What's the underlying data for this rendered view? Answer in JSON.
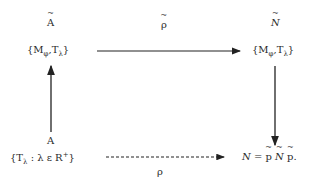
{
  "diagram": {
    "nodes": {
      "top_left_label": "A",
      "top_left": {
        "open": "{M",
        "sub1": "φ",
        "comma": ",T",
        "sub2": "λ",
        "close": "}"
      },
      "top_right_label": "N",
      "top_right": {
        "open": "{M",
        "sub1": "φ",
        "comma": ",T",
        "sub2": "λ",
        "close": "}"
      },
      "bottom_left_label": "A",
      "bottom_left": {
        "open": "{T",
        "sub1": "λ",
        "mid": " : λ ε R",
        "sup": "+",
        "close": "}"
      },
      "bottom_right": {
        "lhs": "N = ",
        "p1": "p",
        "n": "N",
        "p2": "p",
        "end": "."
      }
    },
    "arrows": {
      "top": {
        "label": "ρ",
        "style": "solid"
      },
      "bottom": {
        "label": "ρ",
        "style": "dashed"
      },
      "left": {
        "direction": "up",
        "style": "solid"
      },
      "right": {
        "direction": "down",
        "style": "solid"
      }
    }
  }
}
